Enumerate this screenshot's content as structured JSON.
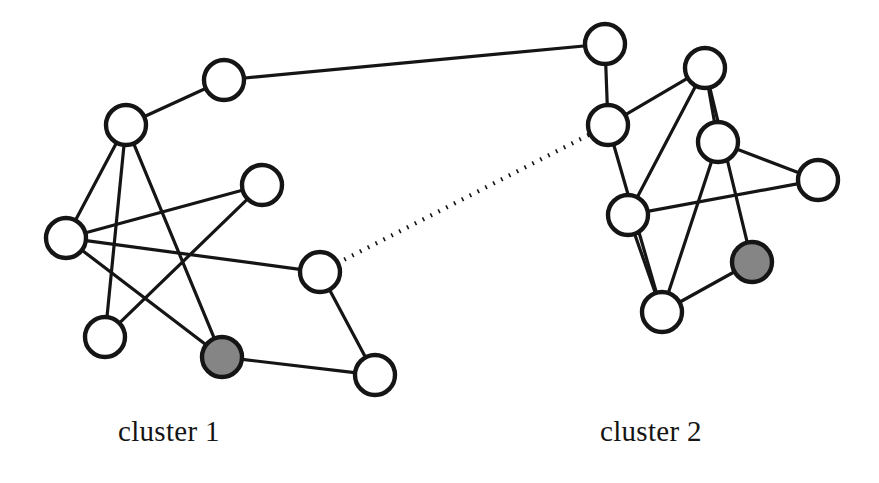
{
  "figure": {
    "background_color": "#ffffff",
    "width": 879,
    "height": 483
  },
  "style": {
    "node_stroke_color": "#151515",
    "node_open_fill": "#ffffff",
    "node_filled_fill": "#858585",
    "node_radius": 20,
    "node_stroke_width": 4.4,
    "edge_color": "#151515",
    "edge_width": 3.2,
    "bridge_edge_style": "dotted"
  },
  "labels": {
    "cluster_1": "cluster 1",
    "cluster_2": "cluster 2"
  },
  "chart_data": {
    "type": "diagram",
    "nodes": [
      {
        "id": "a1",
        "cluster": "cluster 1",
        "x": 224,
        "y": 80,
        "fill": "open"
      },
      {
        "id": "a2",
        "cluster": "cluster 1",
        "x": 126,
        "y": 125,
        "fill": "open"
      },
      {
        "id": "a3",
        "cluster": "cluster 1",
        "x": 262,
        "y": 185,
        "fill": "open"
      },
      {
        "id": "a4",
        "cluster": "cluster 1",
        "x": 66,
        "y": 238,
        "fill": "open"
      },
      {
        "id": "a5",
        "cluster": "cluster 1",
        "x": 320,
        "y": 272,
        "fill": "open"
      },
      {
        "id": "a6",
        "cluster": "cluster 1",
        "x": 105,
        "y": 337,
        "fill": "open"
      },
      {
        "id": "a7",
        "cluster": "cluster 1",
        "x": 222,
        "y": 357,
        "fill": "filled"
      },
      {
        "id": "a8",
        "cluster": "cluster 1",
        "x": 375,
        "y": 375,
        "fill": "open"
      },
      {
        "id": "b1",
        "cluster": "cluster 2",
        "x": 605,
        "y": 44,
        "fill": "open"
      },
      {
        "id": "b2",
        "cluster": "cluster 2",
        "x": 705,
        "y": 68,
        "fill": "open"
      },
      {
        "id": "b3",
        "cluster": "cluster 2",
        "x": 608,
        "y": 125,
        "fill": "open"
      },
      {
        "id": "b4",
        "cluster": "cluster 2",
        "x": 718,
        "y": 142,
        "fill": "open"
      },
      {
        "id": "b5",
        "cluster": "cluster 2",
        "x": 818,
        "y": 180,
        "fill": "open"
      },
      {
        "id": "b6",
        "cluster": "cluster 2",
        "x": 628,
        "y": 215,
        "fill": "open"
      },
      {
        "id": "b7",
        "cluster": "cluster 2",
        "x": 752,
        "y": 262,
        "fill": "filled"
      },
      {
        "id": "b8",
        "cluster": "cluster 2",
        "x": 662,
        "y": 312,
        "fill": "open"
      }
    ],
    "edges": [
      {
        "source": "a2",
        "target": "a1",
        "style": "solid"
      },
      {
        "source": "a1",
        "target": "b1",
        "style": "solid"
      },
      {
        "source": "a2",
        "target": "a4",
        "style": "solid"
      },
      {
        "source": "a2",
        "target": "a6",
        "style": "solid"
      },
      {
        "source": "a2",
        "target": "a7",
        "style": "solid"
      },
      {
        "source": "a4",
        "target": "a3",
        "style": "solid"
      },
      {
        "source": "a4",
        "target": "a5",
        "style": "solid"
      },
      {
        "source": "a4",
        "target": "a7",
        "style": "solid"
      },
      {
        "source": "a3",
        "target": "a6",
        "style": "solid"
      },
      {
        "source": "a5",
        "target": "a8",
        "style": "solid"
      },
      {
        "source": "a7",
        "target": "a8",
        "style": "solid"
      },
      {
        "source": "a5",
        "target": "b3",
        "style": "dotted"
      },
      {
        "source": "b1",
        "target": "b3",
        "style": "solid"
      },
      {
        "source": "b3",
        "target": "b2",
        "style": "solid"
      },
      {
        "source": "b3",
        "target": "b8",
        "style": "solid"
      },
      {
        "source": "b2",
        "target": "b4",
        "style": "solid"
      },
      {
        "source": "b2",
        "target": "b6",
        "style": "solid"
      },
      {
        "source": "b2",
        "target": "b7",
        "style": "solid"
      },
      {
        "source": "b4",
        "target": "b5",
        "style": "solid"
      },
      {
        "source": "b4",
        "target": "b8",
        "style": "solid"
      },
      {
        "source": "b6",
        "target": "b5",
        "style": "solid"
      },
      {
        "source": "b6",
        "target": "b8",
        "style": "solid"
      },
      {
        "source": "b8",
        "target": "b7",
        "style": "solid"
      }
    ]
  }
}
